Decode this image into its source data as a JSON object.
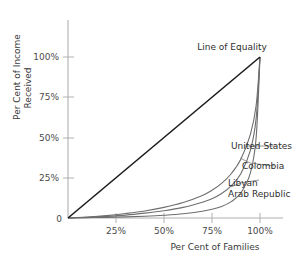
{
  "chart_data": {
    "type": "line",
    "title": "",
    "xlabel": "Per Cent of Families",
    "ylabel_line1": "Per Cent of Income",
    "ylabel_line2": "Received",
    "xlim": [
      0,
      100
    ],
    "ylim": [
      0,
      100
    ],
    "grid": false,
    "legend_position": "inline-right-annotations",
    "xticks": [
      {
        "value": 25,
        "label": "25%"
      },
      {
        "value": 50,
        "label": "50%"
      },
      {
        "value": 75,
        "label": "75%"
      },
      {
        "value": 100,
        "label": "100%"
      }
    ],
    "yticks": [
      {
        "value": 0,
        "label": "0"
      },
      {
        "value": 25,
        "label": "25%"
      },
      {
        "value": 50,
        "label": "50%"
      },
      {
        "value": 75,
        "label": "75%"
      },
      {
        "value": 100,
        "label": "100%"
      }
    ],
    "annotations": [
      {
        "name": "line-of-equality",
        "text": "Line of Equality"
      }
    ],
    "series": [
      {
        "name": "Line of Equality",
        "label": "Line of Equality",
        "color": "#1c1c1c",
        "width": 1.6,
        "x": [
          0,
          100
        ],
        "values": [
          0,
          100
        ]
      },
      {
        "name": "United States",
        "label": "United States",
        "color": "#6e6e6e",
        "width": 1.1,
        "x": [
          0,
          10,
          20,
          30,
          40,
          50,
          60,
          70,
          75,
          80,
          85,
          90,
          95,
          98,
          100
        ],
        "values": [
          0,
          0.6,
          1.5,
          2.8,
          4.4,
          6.6,
          9.6,
          14.0,
          17.2,
          21.5,
          27.5,
          36.5,
          52.0,
          70.0,
          100
        ]
      },
      {
        "name": "Colombia",
        "label": "Colombia",
        "color": "#6e6e6e",
        "width": 1.1,
        "x": [
          0,
          10,
          20,
          30,
          40,
          50,
          60,
          70,
          75,
          80,
          85,
          90,
          95,
          98,
          100
        ],
        "values": [
          0,
          0.4,
          1.0,
          1.8,
          3.0,
          4.5,
          6.6,
          9.8,
          12.0,
          15.2,
          20.0,
          27.5,
          42.0,
          62.0,
          100
        ]
      },
      {
        "name": "Libyan Arab Republic",
        "label": "Libyan Arab Republic",
        "label_line1": "Libyan",
        "label_line2": "Arab Republic",
        "color": "#6e6e6e",
        "width": 1.1,
        "x": [
          0,
          10,
          20,
          30,
          40,
          50,
          60,
          70,
          75,
          80,
          85,
          90,
          95,
          98,
          100
        ],
        "values": [
          0,
          0.2,
          0.4,
          0.7,
          1.1,
          1.7,
          2.6,
          4.2,
          5.4,
          7.2,
          10.2,
          15.5,
          28.0,
          50.0,
          100
        ]
      }
    ]
  },
  "colors": {
    "axis": "#b0b0b0",
    "equality_line": "#1c1c1c",
    "curve": "#6e6e6e",
    "leader_line": "#8a8a8a",
    "text": "#3a3a3a",
    "background": "#ffffff"
  }
}
